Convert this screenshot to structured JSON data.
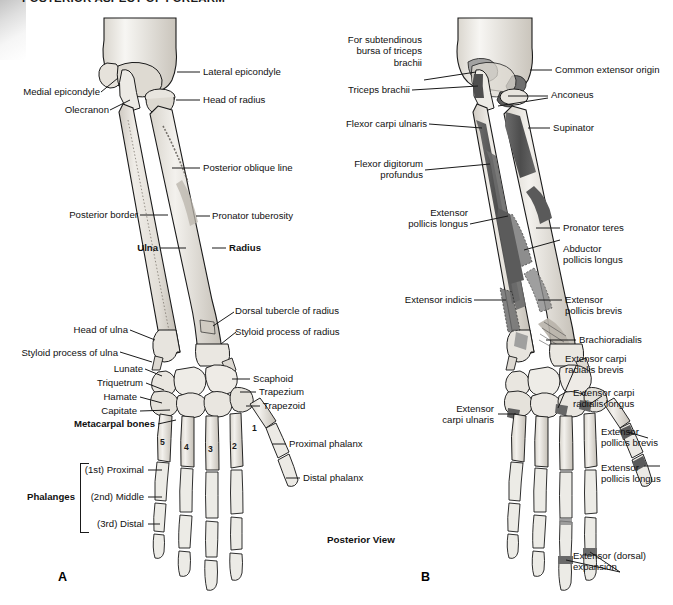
{
  "document": {
    "title": "POSTERIOR ASPECT OF FOREARM",
    "view_label": "Posterior View"
  },
  "panels": [
    {
      "letter": "A",
      "subject": "bones-of-posterior-forearm-and-hand",
      "labels": [
        {
          "text": "Medial epicondyle"
        },
        {
          "text": "Lateral epicondyle"
        },
        {
          "text": "Olecranon"
        },
        {
          "text": "Head of radius"
        },
        {
          "text": "Posterior oblique line"
        },
        {
          "text": "Posterior border"
        },
        {
          "text": "Pronator tuberosity"
        },
        {
          "text": "Ulna"
        },
        {
          "text": "Radius"
        },
        {
          "text": "Dorsal tubercle of radius"
        },
        {
          "text": "Styloid process of radius"
        },
        {
          "text": "Head of ulna"
        },
        {
          "text": "Styloid process of ulna"
        },
        {
          "text": "Lunate"
        },
        {
          "text": "Scaphoid"
        },
        {
          "text": "Triquetrum"
        },
        {
          "text": "Trapezium"
        },
        {
          "text": "Hamate"
        },
        {
          "text": "Trapezoid"
        },
        {
          "text": "Capitate"
        },
        {
          "text": "Metacarpal bones"
        },
        {
          "text": "Proximal phalanx"
        },
        {
          "text": "Distal phalanx"
        },
        {
          "text": "Phalanges"
        },
        {
          "text": "(1st) Proximal"
        },
        {
          "text": "(2nd) Middle"
        },
        {
          "text": "(3rd) Distal"
        }
      ],
      "metacarpal_numbers": [
        "1",
        "2",
        "3",
        "4",
        "5"
      ]
    },
    {
      "letter": "B",
      "subject": "muscle-attachments-of-posterior-forearm-and-hand",
      "labels": [
        {
          "text": "For subtendinous\nbursa of triceps\nbrachii"
        },
        {
          "text": "Common extensor origin"
        },
        {
          "text": "Triceps brachii"
        },
        {
          "text": "Anconeus"
        },
        {
          "text": "Flexor carpi ulnaris"
        },
        {
          "text": "Supinator"
        },
        {
          "text": "Flexor digitorum\nprofundus"
        },
        {
          "text": "Extensor\npollicis longus"
        },
        {
          "text": "Pronator teres"
        },
        {
          "text": "Abductor\npollicis longus"
        },
        {
          "text": "Extensor indicis"
        },
        {
          "text": "Extensor\npollicis brevis"
        },
        {
          "text": "Brachioradialis"
        },
        {
          "text": "Extensor carpi\nradialis brevis"
        },
        {
          "text": "Extensor carpi\nradialis longus"
        },
        {
          "text": "Extensor\ncarpi ulnaris"
        },
        {
          "text": "Extensor\npollicis brevis"
        },
        {
          "text": "Extensor\npollicis longus"
        },
        {
          "text": "Extensor (dorsal)\nexpansion"
        }
      ]
    }
  ],
  "colors": {
    "ink": "#1a1a1a",
    "bone_light": "#ece9e3",
    "bone_mid": "#d4d0c8",
    "bone_shadow": "#b4afa6",
    "muscle_dark": "#555555",
    "muscle_mid": "#7d7d7d",
    "background": "#ffffff"
  }
}
